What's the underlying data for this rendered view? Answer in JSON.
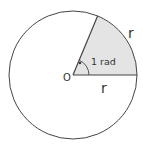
{
  "diagram": {
    "center_label": "O",
    "angle_label": "1 rad",
    "radius_label": "r",
    "arc_label": "r",
    "colors": {
      "stroke": "#444444",
      "sector_fill": "#e4e4e4",
      "text": "#333333"
    }
  }
}
